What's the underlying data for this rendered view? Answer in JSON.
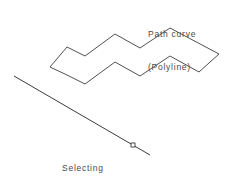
{
  "canvas": {
    "width": 249,
    "height": 180,
    "background_color": "#ffffff",
    "line_color": "#3c3c3c",
    "text_color": "#4a4a4a"
  },
  "labels": {
    "path_curve": {
      "line1": "Path curve",
      "line2": "(Polyline)"
    },
    "axis_of_revolution": {
      "line1": "Selecting",
      "line2": "axis of",
      "line3": "revolution"
    }
  },
  "shapes": {
    "path_curve_polyline": {
      "name": "Path curve (Polyline)",
      "closed": true,
      "points": "50,67 67,47 85,56 115,34 140,48 170,28 219,54 199,72 170,56 140,76 115,62 85,84 67,75"
    },
    "axis_line": {
      "name": "Axis of revolution",
      "x1": 14,
      "y1": 76,
      "x2": 150,
      "y2": 155
    },
    "grip": {
      "name": "Selection grip",
      "cx": 133,
      "cy": 145,
      "size": 4,
      "fill": "#ffffff",
      "stroke": "#3c3c3c"
    }
  }
}
